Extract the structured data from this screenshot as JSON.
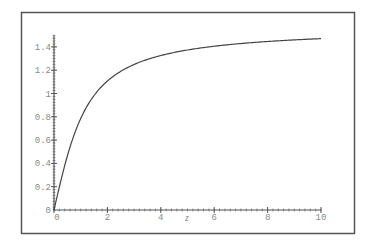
{
  "chart_data": {
    "type": "line",
    "title": "",
    "xlabel": "z",
    "ylabel": "",
    "xlim": [
      0,
      10
    ],
    "ylim": [
      0,
      1.5
    ],
    "grid": false,
    "legend": null,
    "x_ticks": [
      0,
      2,
      4,
      6,
      8,
      10
    ],
    "x_tick_labels": [
      "0",
      "2",
      "4",
      "6",
      "8",
      "10"
    ],
    "y_ticks": [
      0.2,
      0.4,
      0.6,
      0.8,
      1,
      1.2,
      1.4
    ],
    "y_tick_labels": [
      "0.2",
      "0.4",
      "0.6",
      "0.8",
      "1",
      "1.2",
      "1.4"
    ],
    "origin_label": "0",
    "series": [
      {
        "name": "curve",
        "x": [
          0,
          0.25,
          0.5,
          0.75,
          1,
          1.5,
          2,
          2.5,
          3,
          3.5,
          4,
          5,
          6,
          7,
          8,
          9,
          10
        ],
        "y": [
          0,
          0.245,
          0.464,
          0.644,
          0.785,
          0.983,
          1.107,
          1.19,
          1.249,
          1.292,
          1.326,
          1.373,
          1.406,
          1.429,
          1.446,
          1.46,
          1.471
        ]
      }
    ]
  },
  "colors": {
    "background": "#ffffff",
    "frame": "#555555",
    "axis": "#555555",
    "curve": "#444444",
    "tick_text": "#8a8a8a"
  }
}
